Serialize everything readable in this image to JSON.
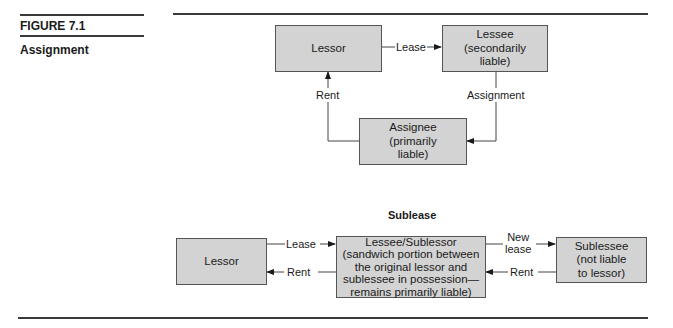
{
  "figure": {
    "number_label": "FIGURE 7.1",
    "caption": "Assignment"
  },
  "assignment_diagram": {
    "nodes": {
      "lessor": "Lessor",
      "lessee": [
        "Lessee",
        "(secondarily",
        "liable)"
      ],
      "assignee": [
        "Assignee",
        "(primarily",
        "liable)"
      ]
    },
    "edges": {
      "lease": "Lease",
      "rent": "Rent",
      "assignment": "Assignment"
    }
  },
  "sublease_diagram": {
    "title": "Sublease",
    "nodes": {
      "lessor": "Lessor",
      "lessee_sublessor": [
        "Lessee/Sublessor",
        "(sandwich portion between",
        "the original lessor and",
        "sublessee in possession—",
        "remains primarily liable)"
      ],
      "sublessee": [
        "Sublessee",
        "(not liable",
        "to lessor)"
      ]
    },
    "edges": {
      "lease": "Lease",
      "rent_left": "Rent",
      "new_lease": [
        "New",
        "lease"
      ],
      "rent_right": "Rent"
    }
  },
  "colors": {
    "box_fill": "#d3d3d3",
    "box_border": "#555555",
    "line": "#333333"
  }
}
